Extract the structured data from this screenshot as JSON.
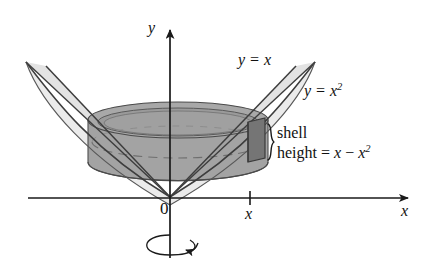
{
  "figure": {
    "background_color": "#ffffff",
    "ink_color": "#111111"
  },
  "axes": {
    "x_axis_label": "x",
    "y_axis_label": "y",
    "origin_label": "0",
    "x_tick_label": "x"
  },
  "curve_labels": {
    "line_label_prefix": "y = ",
    "line_label_var": "x",
    "parabola_label_prefix": "y = ",
    "parabola_label_var": "x",
    "parabola_label_exponent": "2"
  },
  "annotation": {
    "line1": "shell",
    "line2_prefix": "height = ",
    "line2_var1": "x",
    "line2_minus": " − ",
    "line2_var2": "x",
    "line2_exponent": "2",
    "brace": "}"
  },
  "rotation": {
    "indicator": "rotation-arrow-about-y-axis"
  },
  "colors": {
    "surface_light": "#e9e9e9",
    "surface_mid": "#c9c9c9",
    "shell_body": "#9e9e9e",
    "shell_top": "#b0b0b0",
    "shell_dark": "#7a7a7a",
    "outline": "#4a4a4a",
    "axis": "#1a1a1a"
  }
}
